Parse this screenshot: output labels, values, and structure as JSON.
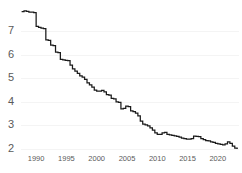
{
  "chart_data": {
    "type": "line",
    "title": "",
    "subtitle": "",
    "xlabel": "",
    "ylabel": "",
    "grid": true,
    "legend": false,
    "legend_position": "none",
    "line_color": "#1a1a1a",
    "grid_color": "#f4f4f4",
    "tick_color": "#5a5a5a",
    "background": "#ffffff",
    "step_style": "post",
    "xlim": [
      1987.5,
      2023.5
    ],
    "ylim": [
      1.85,
      8.05
    ],
    "yticks": [
      2,
      3,
      4,
      5,
      6,
      7
    ],
    "ytick_labels": [
      "2",
      "3",
      "4",
      "5",
      "6",
      "7"
    ],
    "xticks": [
      1990,
      1995,
      2000,
      2005,
      2010,
      2015,
      2020
    ],
    "xtick_labels": [
      "1990",
      "1995",
      "2000",
      "2005",
      "2010",
      "2015",
      "2020"
    ],
    "series": [
      {
        "name": "series-1",
        "x": [
          1987.6,
          1988.0,
          1988.4,
          1988.8,
          1989.2,
          1989.6,
          1990.0,
          1990.4,
          1990.8,
          1991.2,
          1991.6,
          1992.0,
          1992.4,
          1992.8,
          1993.2,
          1993.6,
          1994.0,
          1994.4,
          1994.8,
          1995.2,
          1995.6,
          1996.0,
          1996.4,
          1996.8,
          1997.2,
          1997.6,
          1998.0,
          1998.4,
          1998.8,
          1999.2,
          1999.6,
          2000.0,
          2000.4,
          2000.8,
          2001.2,
          2001.6,
          2002.0,
          2002.4,
          2002.8,
          2003.2,
          2003.6,
          2004.0,
          2004.4,
          2004.8,
          2005.2,
          2005.6,
          2006.0,
          2006.4,
          2006.8,
          2007.2,
          2007.6,
          2008.0,
          2008.4,
          2008.8,
          2009.2,
          2009.6,
          2010.0,
          2010.4,
          2010.8,
          2011.2,
          2011.6,
          2012.0,
          2012.4,
          2012.8,
          2013.2,
          2013.6,
          2014.0,
          2014.4,
          2014.8,
          2015.2,
          2015.6,
          2016.0,
          2016.4,
          2016.8,
          2017.2,
          2017.6,
          2018.0,
          2018.4,
          2018.8,
          2019.2,
          2019.6,
          2020.0,
          2020.4,
          2020.8,
          2021.2,
          2021.6,
          2022.0,
          2022.4,
          2022.8,
          2023.2
        ],
        "y": [
          7.82,
          7.85,
          7.83,
          7.8,
          7.8,
          7.78,
          7.2,
          7.15,
          7.12,
          7.1,
          6.62,
          6.6,
          6.4,
          6.38,
          6.1,
          6.08,
          5.8,
          5.78,
          5.76,
          5.74,
          5.55,
          5.4,
          5.3,
          5.2,
          5.1,
          5.05,
          4.95,
          4.8,
          4.72,
          4.62,
          4.5,
          4.45,
          4.45,
          4.48,
          4.42,
          4.3,
          4.28,
          4.15,
          4.12,
          4.0,
          3.98,
          3.7,
          3.72,
          3.82,
          3.8,
          3.62,
          3.58,
          3.52,
          3.4,
          3.18,
          3.05,
          3.02,
          2.98,
          2.9,
          2.8,
          2.68,
          2.62,
          2.62,
          2.68,
          2.7,
          2.62,
          2.6,
          2.58,
          2.56,
          2.54,
          2.5,
          2.46,
          2.44,
          2.42,
          2.42,
          2.44,
          2.55,
          2.54,
          2.52,
          2.44,
          2.4,
          2.36,
          2.34,
          2.3,
          2.28,
          2.24,
          2.22,
          2.2,
          2.18,
          2.22,
          2.3,
          2.24,
          2.12,
          2.04,
          2.0
        ]
      }
    ]
  },
  "axes": {
    "y_axis_name": "y-axis",
    "x_axis_name": "x-axis"
  }
}
